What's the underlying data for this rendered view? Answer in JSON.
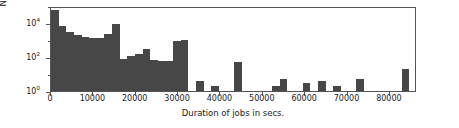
{
  "chart_data": {
    "type": "bar",
    "title": "",
    "subtitle": "",
    "xlabel": "Duration of jobs in secs.",
    "ylabel": "Number of jobs",
    "xlim": [
      0,
      86400
    ],
    "ylim": [
      1,
      100000
    ],
    "yscale": "log",
    "xscale": "linear",
    "grid": false,
    "legend": null,
    "bar_color": "#474747",
    "bin_width": 1800,
    "xticks": [
      0,
      10000,
      20000,
      30000,
      40000,
      50000,
      60000,
      70000,
      80000
    ],
    "xtick_labels": [
      "0",
      "10000",
      "20000",
      "30000",
      "40000",
      "50000",
      "60000",
      "70000",
      "80000"
    ],
    "yticks": [
      1,
      100,
      10000
    ],
    "ytick_labels": [
      "10⁰",
      "10²",
      "10⁴"
    ],
    "ytick_sup": [
      "0",
      "2",
      "4"
    ],
    "ytick_base": "10",
    "yminor_ticks": [
      10,
      1000,
      100000
    ],
    "bin_edges": [
      0,
      1800,
      3600,
      5400,
      7200,
      9000,
      10800,
      12600,
      14400,
      16200,
      18000,
      19800,
      21600,
      23400,
      25200,
      27000,
      28800,
      30600,
      32400,
      34200,
      36000,
      37800,
      39600,
      41400,
      43200,
      45000,
      46800,
      48600,
      50400,
      52200,
      54000,
      55800,
      57600,
      59400,
      61200,
      63000,
      64800,
      66600,
      68400,
      70200,
      72000,
      73800,
      75600,
      77400,
      79200,
      81000,
      82800,
      84600,
      86400
    ],
    "categories": [
      "0-1800",
      "1800-3600",
      "3600-5400",
      "5400-7200",
      "7200-9000",
      "9000-10800",
      "10800-12600",
      "12600-14400",
      "14400-16200",
      "16200-18000",
      "18000-19800",
      "19800-21600",
      "21600-23400",
      "23400-25200",
      "25200-27000",
      "27000-28800",
      "28800-30600",
      "30600-32400",
      "32400-34200",
      "34200-36000",
      "36000-37800",
      "37800-39600",
      "39600-41400",
      "41400-43200",
      "43200-45000",
      "45000-46800",
      "46800-48600",
      "48600-50400",
      "50400-52200",
      "52200-54000",
      "54000-55800",
      "55800-57600",
      "57600-59400",
      "59400-61200",
      "61200-63000",
      "63000-64800",
      "64800-66600",
      "66600-68400",
      "68400-70200",
      "70200-72000",
      "72000-73800",
      "73800-75600",
      "75600-77400",
      "77400-79200",
      "79200-81000",
      "81000-82800",
      "82800-84600",
      "84600-86400"
    ],
    "values": [
      60000,
      7000,
      3000,
      2000,
      1600,
      1400,
      1300,
      2400,
      9000,
      80,
      110,
      150,
      300,
      70,
      55,
      60,
      900,
      1000,
      0,
      4,
      0,
      2,
      0,
      0,
      50,
      0,
      0,
      0,
      0,
      2,
      5,
      0,
      0,
      3,
      0,
      4,
      0,
      2,
      0,
      0,
      5,
      0,
      0,
      0,
      0,
      0,
      20,
      0
    ]
  }
}
